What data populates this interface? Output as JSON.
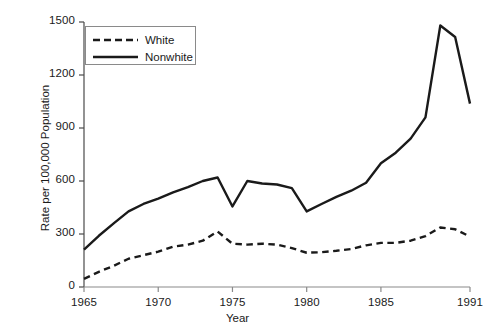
{
  "chart_data": {
    "type": "line",
    "title": "",
    "xlabel": "Year",
    "ylabel": "Rate per 100,000 Population",
    "xlim": [
      1965,
      1991
    ],
    "ylim": [
      0,
      1500
    ],
    "xticks": [
      1965,
      1970,
      1975,
      1980,
      1985,
      1991
    ],
    "yticks": [
      0,
      300,
      600,
      900,
      1200,
      1500
    ],
    "grid": false,
    "legend_position": "upper-left",
    "x": [
      1965,
      1966,
      1967,
      1968,
      1969,
      1970,
      1971,
      1972,
      1973,
      1974,
      1975,
      1976,
      1977,
      1978,
      1979,
      1980,
      1981,
      1982,
      1983,
      1984,
      1985,
      1986,
      1987,
      1988,
      1989,
      1990,
      1991
    ],
    "series": [
      {
        "name": "White",
        "style": "dashed",
        "color": "#1a1a1a",
        "values": [
          46,
          86,
          120,
          160,
          180,
          200,
          228,
          240,
          262,
          314,
          245,
          240,
          245,
          240,
          220,
          194,
          197,
          205,
          215,
          236,
          250,
          250,
          262,
          288,
          337,
          327,
          285
        ]
      },
      {
        "name": "Nonwhite",
        "style": "solid",
        "color": "#1a1a1a",
        "values": [
          211,
          290,
          360,
          428,
          470,
          500,
          535,
          565,
          600,
          620,
          456,
          600,
          586,
          580,
          560,
          428,
          470,
          510,
          545,
          590,
          700,
          760,
          840,
          960,
          1480,
          1415,
          1038
        ]
      }
    ]
  },
  "legend": {
    "entries": [
      {
        "label": "White",
        "style": "dashed"
      },
      {
        "label": "Nonwhite",
        "style": "solid"
      }
    ]
  },
  "axes": {
    "x_title": "Year",
    "y_title": "Rate per 100,000 Population",
    "x_tick_labels": [
      "1965",
      "1970",
      "1975",
      "1980",
      "1985",
      "1991"
    ],
    "y_tick_labels": [
      "0",
      "300",
      "600",
      "900",
      "1200",
      "1500"
    ]
  }
}
